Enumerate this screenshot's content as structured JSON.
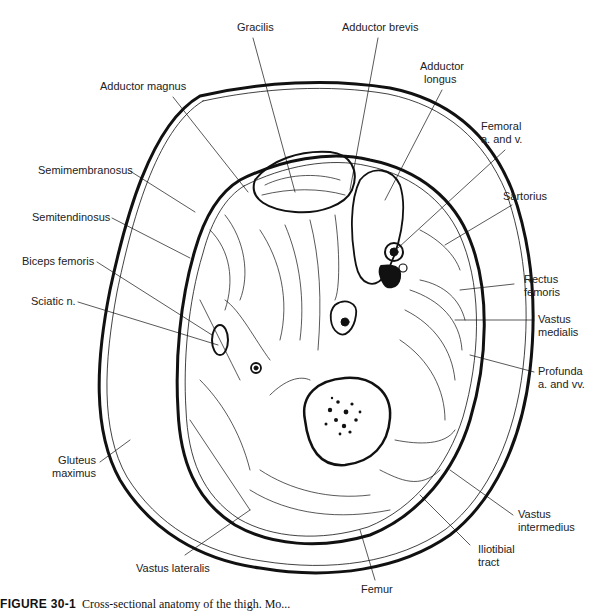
{
  "figure": {
    "caption_label": "FIGURE 30-1",
    "caption_text": "Cross-sectional anatomy of the thigh. Mo..."
  },
  "labels": {
    "gracilis": "Gracilis",
    "adductor_brevis": "Adductor brevis",
    "adductor_longus_1": "Adductor",
    "adductor_longus_2": "longus",
    "adductor_magnus": "Adductor magnus",
    "femoral_1": "Femoral",
    "femoral_2": "a. and v.",
    "semimembranosus": "Semimembranosus",
    "sartorius": "Sartorius",
    "semitendinosus": "Semitendinosus",
    "biceps_femoris": "Biceps femoris",
    "rectus_1": "Rectus",
    "rectus_2": "femoris",
    "sciatic": "Sciatic n.",
    "vastus_medialis_1": "Vastus",
    "vastus_medialis_2": "medialis",
    "profunda_1": "Profunda",
    "profunda_2": "a. and vv.",
    "gluteus_1": "Gluteus",
    "gluteus_2": "maximus",
    "vastus_intermedius_1": "Vastus",
    "vastus_intermedius_2": "intermedius",
    "iliotibial_1": "Iliotibial",
    "iliotibial_2": "tract",
    "vastus_lateralis": "Vastus lateralis",
    "femur": "Femur"
  }
}
